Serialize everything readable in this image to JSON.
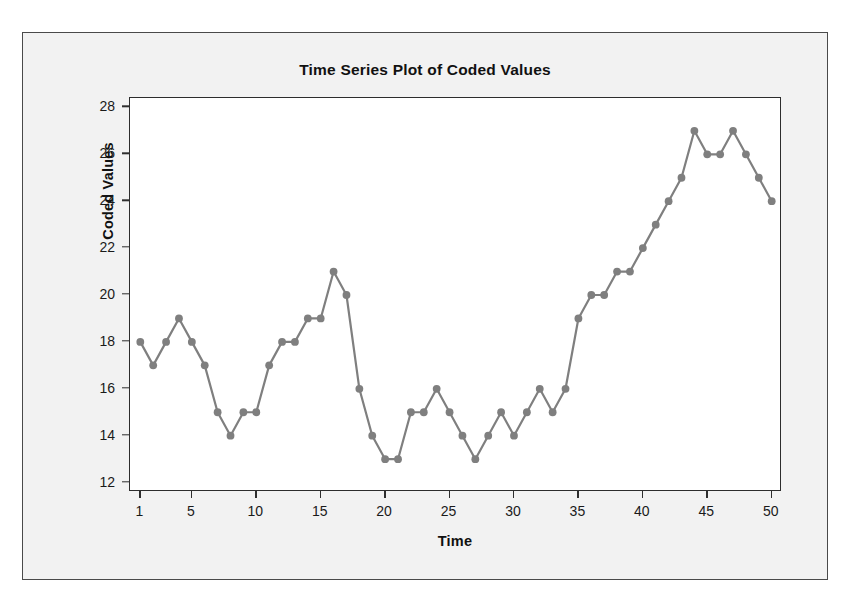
{
  "page_fragment": "",
  "figure": {
    "background_color": "#f2f2f2",
    "plot_background_color": "#ffffff",
    "border_color": "#4a4a4a"
  },
  "chart_data": {
    "type": "line",
    "title": "Time Series Plot of Coded Values",
    "xlabel": "Time",
    "ylabel": "Coded Values",
    "series_color": "#7f7f7f",
    "marker": "circle",
    "xlim": [
      0.2,
      50.8
    ],
    "ylim": [
      11.6,
      28.4
    ],
    "grid": false,
    "legend": null,
    "x_ticks": [
      1,
      5,
      10,
      15,
      20,
      25,
      30,
      35,
      40,
      45,
      50
    ],
    "y_ticks": [
      12,
      14,
      16,
      18,
      20,
      22,
      24,
      26,
      28
    ],
    "x": [
      1,
      2,
      3,
      4,
      5,
      6,
      7,
      8,
      9,
      10,
      11,
      12,
      13,
      14,
      15,
      16,
      17,
      18,
      19,
      20,
      21,
      22,
      23,
      24,
      25,
      26,
      27,
      28,
      29,
      30,
      31,
      32,
      33,
      34,
      35,
      36,
      37,
      38,
      39,
      40,
      41,
      42,
      43,
      44,
      45,
      46,
      47,
      48,
      49,
      50
    ],
    "values": [
      18,
      17,
      18,
      19,
      18,
      17,
      15,
      14,
      15,
      15,
      17,
      18,
      18,
      19,
      19,
      21,
      20,
      16,
      14,
      13,
      13,
      15,
      15,
      16,
      15,
      14,
      13,
      14,
      15,
      14,
      15,
      16,
      15,
      16,
      19,
      20,
      20,
      21,
      21,
      22,
      23,
      24,
      25,
      27,
      26,
      26,
      27,
      26,
      25,
      24
    ]
  }
}
